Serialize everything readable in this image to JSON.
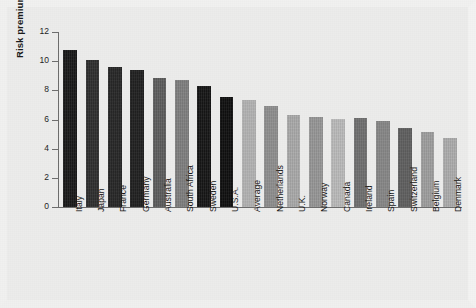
{
  "chart_data": {
    "type": "bar",
    "title": "",
    "xlabel": "",
    "ylabel": "Risk premium (%)",
    "ylim": [
      0,
      12
    ],
    "yticks": [
      0,
      2,
      4,
      6,
      8,
      10,
      12
    ],
    "ytick_labels": [
      "0",
      "2",
      "4",
      "6",
      "8",
      "10",
      "12"
    ],
    "grid": false,
    "legend": "none",
    "categories": [
      "Italy",
      "Japan",
      "France",
      "Germany",
      "Australia",
      "South Africa",
      "Sweden",
      "U.S.A.",
      "Average",
      "Netherlands",
      "U.K.",
      "Norway",
      "Canada",
      "Ireland",
      "Spain",
      "Switzerland",
      "Belgium",
      "Denmark"
    ],
    "values": [
      10.8,
      10.1,
      9.6,
      9.4,
      8.85,
      8.7,
      8.3,
      7.55,
      7.35,
      6.9,
      6.3,
      6.15,
      6.05,
      6.1,
      5.9,
      5.4,
      5.15,
      4.75
    ],
    "bar_colors": [
      "#181818",
      "#2e2e2e",
      "#262626",
      "#1f1f1f",
      "#5c5c5c",
      "#7e7e7e",
      "#151515",
      "#0e0e0e",
      "#b2b2b2",
      "#8e8e8e",
      "#a8a8a8",
      "#959595",
      "#b9b9b9",
      "#6e6e6e",
      "#868686",
      "#5e5e5e",
      "#9d9d9d",
      "#ababab"
    ],
    "axis_color": "#6d6d6d",
    "background_color": "#ececeb",
    "text_color": "#161616"
  }
}
